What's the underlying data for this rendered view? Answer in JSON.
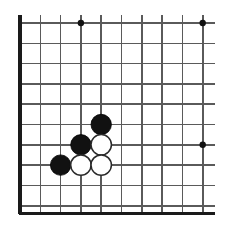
{
  "diagram": {
    "type": "go-board",
    "colors": {
      "background": "#ffffff",
      "grid_line": "#5a5a5a",
      "border_line": "#1a1a1a",
      "black_stone": "#111111",
      "white_stone": "#ffffff",
      "white_stone_outline": "#2a2a2a",
      "star_point": "#111111"
    },
    "geometry": {
      "width": 228,
      "height": 233,
      "grid_spacing": 20.3,
      "stone_radius": 10.2,
      "star_point_radius": 3.2,
      "columns_x": [
        20,
        40.3,
        60.6,
        80.9,
        101.2,
        121.5,
        141.8,
        162.1,
        182.4,
        202.7
      ],
      "rows_y": [
        23,
        43.3,
        63.6,
        83.9,
        104.2,
        124.5,
        144.8,
        165.1,
        185.4,
        205.7
      ],
      "top_overhang": 8,
      "right_crop_x": 215,
      "bottom_border_y": 213.5,
      "left_border_x": 20
    },
    "edges": {
      "top": "open",
      "left": "border",
      "bottom": "border",
      "right": "cropped"
    },
    "star_points": [
      {
        "label": "top-left-hoshi",
        "x": 80.9,
        "y": 23
      },
      {
        "label": "top-right-hoshi",
        "x": 202.7,
        "y": 23
      },
      {
        "label": "right-side-hoshi",
        "x": 202.7,
        "y": 144.8
      }
    ],
    "stones": [
      {
        "label": "black-stone-1",
        "color": "black",
        "x": 101.2,
        "y": 124.5
      },
      {
        "label": "black-stone-2",
        "color": "black",
        "x": 80.9,
        "y": 144.8
      },
      {
        "label": "white-stone-1",
        "color": "white",
        "x": 101.2,
        "y": 144.8
      },
      {
        "label": "black-stone-3",
        "color": "black",
        "x": 60.6,
        "y": 165.1
      },
      {
        "label": "white-stone-2",
        "color": "white",
        "x": 80.9,
        "y": 165.1
      },
      {
        "label": "white-stone-3",
        "color": "white",
        "x": 101.2,
        "y": 165.1
      }
    ]
  }
}
